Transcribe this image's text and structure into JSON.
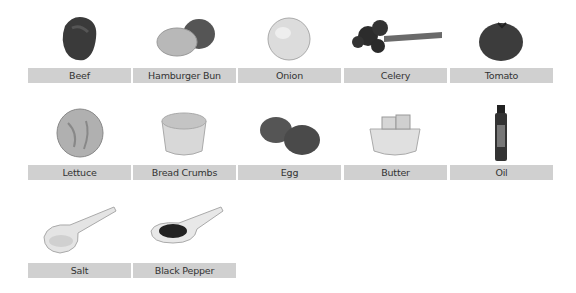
{
  "ingredients": [
    {
      "name": "Beef",
      "icon": "beef-icon"
    },
    {
      "name": "Hamburger Bun",
      "icon": "hamburger-bun-icon"
    },
    {
      "name": "Onion",
      "icon": "onion-icon"
    },
    {
      "name": "Celery",
      "icon": "celery-icon"
    },
    {
      "name": "Tomato",
      "icon": "tomato-icon"
    },
    {
      "name": "Lettuce",
      "icon": "lettuce-icon"
    },
    {
      "name": "Bread Crumbs",
      "icon": "bread-crumbs-icon"
    },
    {
      "name": "Egg",
      "icon": "egg-icon"
    },
    {
      "name": "Butter",
      "icon": "butter-icon"
    },
    {
      "name": "Oil",
      "icon": "oil-icon"
    },
    {
      "name": "Salt",
      "icon": "salt-icon"
    },
    {
      "name": "Black Pepper",
      "icon": "black-pepper-icon"
    }
  ],
  "colors": {
    "label_bg": "#d0d0d0",
    "label_text": "#333333",
    "background": "#ffffff"
  }
}
